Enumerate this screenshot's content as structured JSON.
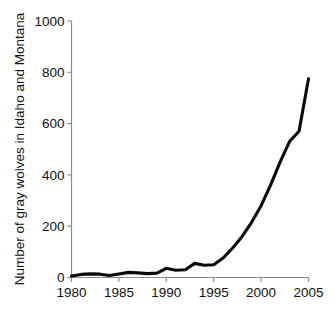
{
  "chart_data": {
    "type": "line",
    "title": "",
    "subtitle": "",
    "xlabel": "",
    "ylabel": "Number of gray wolves in Idaho and Montana",
    "xlim": [
      1980,
      2005
    ],
    "ylim": [
      0,
      1000
    ],
    "xticks": [
      1980,
      1985,
      1990,
      1995,
      2000,
      2005
    ],
    "yticks": [
      0,
      200,
      400,
      600,
      800,
      1000
    ],
    "xtick_labels": [
      "1980",
      "1985",
      "1990",
      "1995",
      "2000",
      "2005"
    ],
    "ytick_labels": [
      "0",
      "200",
      "400",
      "600",
      "800",
      "1000"
    ],
    "grid": false,
    "legend": false,
    "legend_position": "none",
    "line_color": "#0a0a0a",
    "axis_color": "#8d8d8d",
    "x": [
      1980,
      1981,
      1982,
      1983,
      1984,
      1985,
      1986,
      1987,
      1988,
      1989,
      1990,
      1991,
      1992,
      1993,
      1994,
      1995,
      1996,
      1997,
      1998,
      1999,
      2000,
      2001,
      2002,
      2003,
      2004,
      2005
    ],
    "series": [
      {
        "name": "Gray wolves in Idaho and Montana",
        "values": [
          6,
          12,
          14,
          13,
          8,
          14,
          20,
          18,
          15,
          17,
          36,
          28,
          30,
          55,
          48,
          50,
          76,
          115,
          160,
          215,
          280,
          360,
          450,
          530,
          570,
          775
        ]
      }
    ]
  },
  "axes": {
    "y_axis_title": "Number of gray wolves in Idaho and Montana"
  }
}
